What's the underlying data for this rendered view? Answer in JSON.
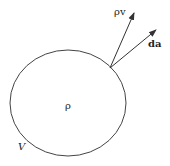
{
  "diagram": {
    "volume_label": "V",
    "density_label": "ρ",
    "flux_vector_label": "ρv",
    "area_vector_label": "da",
    "stroke_color": "#333333"
  }
}
